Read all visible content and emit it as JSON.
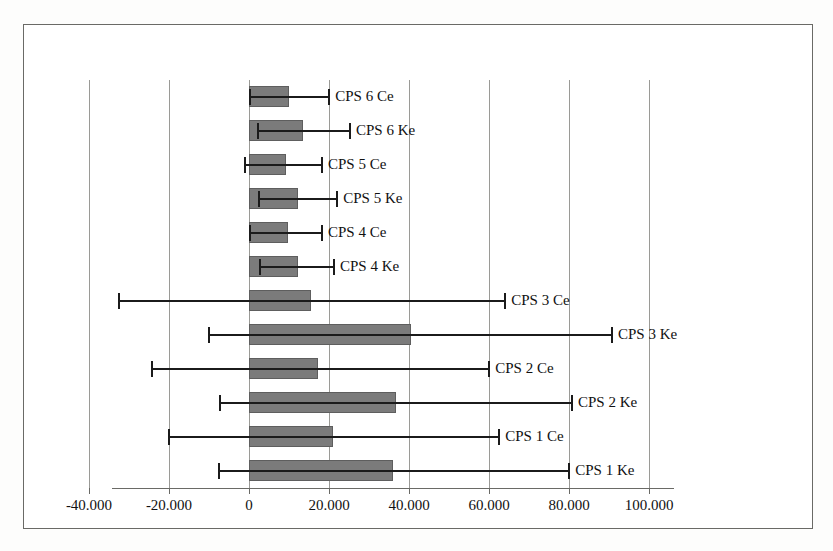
{
  "chart_data": {
    "type": "bar",
    "orientation": "horizontal",
    "title": "",
    "xlabel": "",
    "ylabel": "",
    "xlim": [
      -40.0,
      100.0
    ],
    "grid": true,
    "legend": false,
    "error_bars": "asymmetric whiskers (confidence interval)",
    "xticks": [
      -40.0,
      -20.0,
      0,
      20.0,
      40.0,
      60.0,
      80.0,
      100.0
    ],
    "xtick_labels": [
      "-40.000",
      "-20.000",
      "0",
      "20.000",
      "40.000",
      "60.000",
      "80.000",
      "100.000"
    ],
    "categories": [
      "CPS 6 Ce",
      "CPS 6 Ke",
      "CPS 5 Ce",
      "CPS 5 Ke",
      "CPS 4 Ce",
      "CPS 4 Ke",
      "CPS 3 Ce",
      "CPS 3 Ke",
      "CPS 2 Ce",
      "CPS 2 Ke",
      "CPS 1 Ce",
      "CPS 1 Ke"
    ],
    "values": [
      10.0,
      13.5,
      9.3,
      12.3,
      9.8,
      12.3,
      15.5,
      40.5,
      17.3,
      36.8,
      21.0,
      36.0
    ],
    "error_low": [
      0.0,
      2.0,
      -1.3,
      2.3,
      0.0,
      2.5,
      -32.8,
      -10.3,
      -24.5,
      -7.5,
      -20.3,
      -7.8
    ],
    "error_high": [
      19.8,
      25.0,
      18.0,
      21.8,
      18.0,
      21.0,
      63.8,
      90.5,
      59.8,
      80.5,
      62.3,
      79.8
    ],
    "bar_color": "#7b7b7b",
    "error_color": "#1b1b1b",
    "grid_color": "#9a9a96",
    "frame_color": "#6a6a66",
    "background": "#ffffff"
  }
}
